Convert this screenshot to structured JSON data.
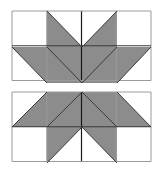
{
  "figure": {
    "colors": {
      "fill": "#8c8c8c",
      "background": "#ffffff",
      "grid_line": "#9a9a9a",
      "diagonal_line": "#3a3a3a",
      "center_line": "#1a1a1a"
    },
    "top_pattern": {
      "origin": [
        12,
        11
      ],
      "cell_size": 34.75,
      "cols": 4,
      "rows": 2,
      "triangles": [
        [
          [
            47,
            11
          ],
          [
            82,
            47
          ],
          [
            47,
            47
          ]
        ],
        [
          [
            117,
            11
          ],
          [
            82,
            47
          ],
          [
            117,
            47
          ]
        ],
        [
          [
            12,
            47
          ],
          [
            47,
            47
          ],
          [
            47,
            83
          ]
        ],
        [
          [
            47,
            47
          ],
          [
            82,
            47
          ],
          [
            82,
            83
          ],
          [
            47,
            83
          ]
        ],
        [
          [
            82,
            47
          ],
          [
            117,
            47
          ],
          [
            117,
            83
          ],
          [
            82,
            83
          ]
        ],
        [
          [
            117,
            47
          ],
          [
            151,
            47
          ],
          [
            117,
            83
          ]
        ]
      ],
      "diagonals": [
        [
          [
            47,
            11
          ],
          [
            82,
            47
          ]
        ],
        [
          [
            117,
            11
          ],
          [
            82,
            47
          ]
        ],
        [
          [
            12,
            47
          ],
          [
            47,
            83
          ]
        ],
        [
          [
            47,
            47
          ],
          [
            82,
            83
          ]
        ],
        [
          [
            117,
            47
          ],
          [
            82,
            83
          ]
        ],
        [
          [
            151,
            47
          ],
          [
            117,
            83
          ]
        ]
      ]
    },
    "bottom_pattern": {
      "origin": [
        12,
        92
      ],
      "cell_size": 34.75,
      "cols": 4,
      "rows": 2,
      "triangles": [
        [
          [
            47,
            92
          ],
          [
            47,
            127
          ],
          [
            12,
            127
          ]
        ],
        [
          [
            47,
            92
          ],
          [
            82,
            92
          ],
          [
            82,
            127
          ],
          [
            47,
            127
          ]
        ],
        [
          [
            82,
            92
          ],
          [
            117,
            92
          ],
          [
            117,
            127
          ],
          [
            82,
            127
          ]
        ],
        [
          [
            117,
            92
          ],
          [
            117,
            127
          ],
          [
            151,
            127
          ]
        ],
        [
          [
            47,
            127
          ],
          [
            82,
            127
          ],
          [
            47,
            163
          ]
        ],
        [
          [
            82,
            127
          ],
          [
            117,
            127
          ],
          [
            117,
            163
          ]
        ]
      ],
      "diagonals": [
        [
          [
            47,
            92
          ],
          [
            12,
            127
          ]
        ],
        [
          [
            82,
            92
          ],
          [
            47,
            127
          ]
        ],
        [
          [
            82,
            92
          ],
          [
            117,
            127
          ]
        ],
        [
          [
            117,
            92
          ],
          [
            151,
            127
          ]
        ],
        [
          [
            82,
            127
          ],
          [
            47,
            163
          ]
        ],
        [
          [
            82,
            127
          ],
          [
            117,
            163
          ]
        ]
      ]
    }
  }
}
